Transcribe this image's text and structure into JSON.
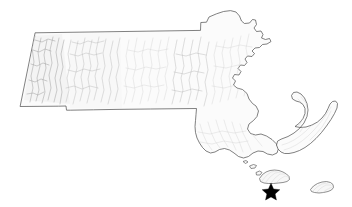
{
  "figure": {
    "kind": "shaded-relief-state-map",
    "width": 352,
    "height": 207,
    "background_color": "#ffffff",
    "land_fill_color": "#fbfbfb",
    "outline_color": "#4a4a4a",
    "relief_shadow_color": "#b8b8b8",
    "marker_color": "#000000",
    "caption": "",
    "title": "",
    "legend": "",
    "axis_labels": []
  },
  "regions": [
    {
      "id": "mainland",
      "name": "Massachusetts mainland",
      "description": "Main body of the state including the Berkshires, Connecticut River Valley, Worcester Hills, Greater Boston, Cape Ann and the South Coast.",
      "has_relief_shading": true
    },
    {
      "id": "cape-cod",
      "name": "Cape Cod",
      "description": "Hooked peninsula extending east then north-northwest in the southeast of the state.",
      "has_relief_shading": true
    },
    {
      "id": "marthas-vineyard",
      "name": "Martha's Vineyard",
      "description": "Triangular island south of Cape Cod.",
      "has_relief_shading": true
    },
    {
      "id": "nantucket",
      "name": "Nantucket",
      "description": "Crescent shaped island southeast of Martha's Vineyard.",
      "has_relief_shading": true
    },
    {
      "id": "elizabeth-islands",
      "name": "Elizabeth Islands",
      "description": "Small chain of islets west of Martha's Vineyard.",
      "has_relief_shading": false
    }
  ],
  "markers": [
    {
      "id": "location-star",
      "symbol": "star",
      "shape": "five-pointed-star",
      "color": "#000000",
      "label": "",
      "x": 271,
      "y": 190,
      "size": 14,
      "placed_near": "Martha's Vineyard"
    }
  ]
}
